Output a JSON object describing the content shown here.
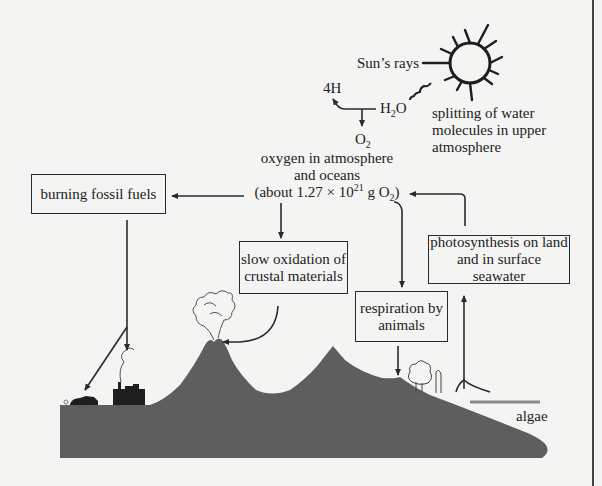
{
  "diagram": {
    "labels": {
      "sun_rays": "Sun’s rays",
      "h2o_prefix": "H",
      "h2o_sub": "2",
      "h2o_suffix": "O",
      "hydrogen": "4H",
      "o2_prefix": "O",
      "o2_sub": "2",
      "splitting_line1": "splitting of water",
      "splitting_line2": "molecules in upper",
      "splitting_line3": "atmosphere",
      "reservoir_line1": "oxygen in atmosphere",
      "reservoir_line2": "and oceans",
      "reservoir_line3_a": "(about 1.27 × 10",
      "reservoir_line3_exp": "21",
      "reservoir_line3_b": " g O",
      "reservoir_line3_sub": "2",
      "reservoir_line3_c": ")",
      "algae": "algae"
    },
    "boxes": {
      "burning": "burning fossil fuels",
      "oxidation_line1": "slow oxidation of",
      "oxidation_line2": "crustal materials",
      "respiration_line1": "respiration by",
      "respiration_line2": "animals",
      "photosynthesis_line1": "photosynthesis on land",
      "photosynthesis_line2": "and in surface",
      "photosynthesis_line3": "seawater"
    },
    "icons": [
      "sun-icon",
      "wavy-ray-icon",
      "volcano-smoke-icon",
      "factory-icon",
      "car-icon",
      "tree-icon"
    ],
    "colors": {
      "background": "#f4f4f2",
      "land": "#5e5e5e",
      "line": "#2a2a2a",
      "sea_surface": "#8a8a8a"
    }
  }
}
